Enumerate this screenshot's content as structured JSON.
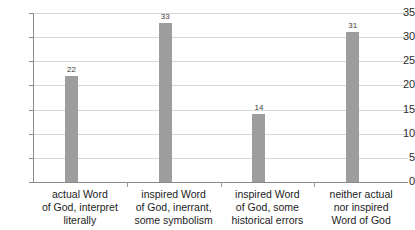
{
  "chart_data": {
    "type": "bar",
    "title": "",
    "subtitle": "",
    "xlabel": "",
    "ylabel": "",
    "ylim": [
      0,
      35
    ],
    "yticks": [
      0,
      5,
      10,
      15,
      20,
      25,
      30,
      35
    ],
    "ytick_labels": [
      "0",
      "5",
      "10",
      "15",
      "20",
      "25",
      "30",
      "35"
    ],
    "grid": true,
    "legend": false,
    "legend_position": "none",
    "bar_color": "#9d9d9d",
    "gridline_color": "#d7d7d7",
    "axis_color": "#8a8a8a",
    "text_color": "#1c1c1c",
    "show_value_labels": true,
    "categories": [
      "actual Word of God, interpret literally",
      "inspired Word of God, inerrant, some symbolism",
      "inspired Word of God, some historical errors",
      "neither actual nor inspired Word of God"
    ],
    "category_lines": [
      [
        "actual Word",
        "of God, interpret",
        "literally"
      ],
      [
        "inspired Word",
        "of God, inerrant,",
        "some symbolism"
      ],
      [
        "inspired Word",
        "of God, some",
        "historical errors"
      ],
      [
        "neither actual",
        "nor inspired",
        "Word of God"
      ]
    ],
    "values": [
      22,
      33,
      14,
      31
    ],
    "value_labels": [
      "22",
      "33",
      "14",
      "31"
    ]
  }
}
